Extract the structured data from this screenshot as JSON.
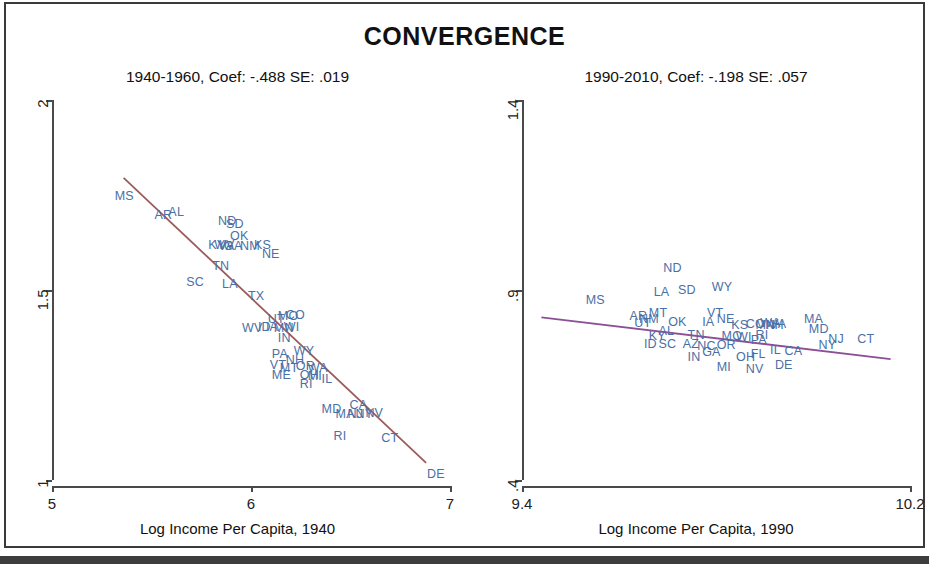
{
  "figure": {
    "title": "CONVERGENCE",
    "background": "#ffffff",
    "label_color": "#4a6fa5"
  },
  "chart_data": [
    {
      "type": "scatter",
      "panel": "left",
      "title": "1940-1960, Coef: -.488 SE: .019",
      "xlabel": "Log Income Per Capita, 1940",
      "ylabel": "",
      "xlim": [
        5,
        7
      ],
      "ylim": [
        1,
        2
      ],
      "xticks": [
        "5",
        "6",
        "7"
      ],
      "xtickvals": [
        5,
        6,
        7
      ],
      "yticks": [
        "1",
        "1.5",
        "2"
      ],
      "ytickvals": [
        1,
        1.5,
        2
      ],
      "grid": false,
      "legend": "none",
      "coefficient": -0.488,
      "standard_error": 0.019,
      "fit_line": {
        "color": "#9c5b5b",
        "x0": 5.36,
        "y0": 1.795,
        "x1": 6.88,
        "y1": 1.045
      },
      "point_label_type": "state-abbreviation",
      "points": [
        {
          "label": "MS",
          "x": 5.36,
          "y": 1.745
        },
        {
          "label": "AR",
          "x": 5.56,
          "y": 1.695
        },
        {
          "label": "AL",
          "x": 5.63,
          "y": 1.702
        },
        {
          "label": "ND",
          "x": 5.88,
          "y": 1.678
        },
        {
          "label": "SD",
          "x": 5.92,
          "y": 1.672
        },
        {
          "label": "OK",
          "x": 5.94,
          "y": 1.639
        },
        {
          "label": "KY",
          "x": 5.83,
          "y": 1.617
        },
        {
          "label": "WV",
          "x": 5.86,
          "y": 1.615
        },
        {
          "label": "VA",
          "x": 5.88,
          "y": 1.613
        },
        {
          "label": "GA",
          "x": 5.91,
          "y": 1.612
        },
        {
          "label": "NM",
          "x": 5.99,
          "y": 1.614
        },
        {
          "label": "KS",
          "x": 6.06,
          "y": 1.616
        },
        {
          "label": "NE",
          "x": 6.1,
          "y": 1.592
        },
        {
          "label": "TN",
          "x": 5.85,
          "y": 1.56
        },
        {
          "label": "SC",
          "x": 5.72,
          "y": 1.518
        },
        {
          "label": "LA",
          "x": 5.9,
          "y": 1.513
        },
        {
          "label": "TX",
          "x": 6.03,
          "y": 1.482
        },
        {
          "label": "UT",
          "x": 6.13,
          "y": 1.42
        },
        {
          "label": "MO",
          "x": 6.18,
          "y": 1.428
        },
        {
          "label": "CO",
          "x": 6.22,
          "y": 1.432
        },
        {
          "label": "WV2",
          "x": 6.0,
          "y": 1.398
        },
        {
          "label": "ID",
          "x": 6.08,
          "y": 1.4
        },
        {
          "label": "IA",
          "x": 6.12,
          "y": 1.399
        },
        {
          "label": "MN",
          "x": 6.16,
          "y": 1.398
        },
        {
          "label": "WI",
          "x": 6.21,
          "y": 1.399
        },
        {
          "label": "IN",
          "x": 6.18,
          "y": 1.371
        },
        {
          "label": "PA",
          "x": 6.15,
          "y": 1.33
        },
        {
          "label": "WY",
          "x": 6.26,
          "y": 1.337
        },
        {
          "label": "NH",
          "x": 6.22,
          "y": 1.312
        },
        {
          "label": "VT",
          "x": 6.14,
          "y": 1.3
        },
        {
          "label": "MT",
          "x": 6.19,
          "y": 1.292
        },
        {
          "label": "OR",
          "x": 6.27,
          "y": 1.298
        },
        {
          "label": "WA",
          "x": 6.33,
          "y": 1.291
        },
        {
          "label": "ME",
          "x": 6.15,
          "y": 1.275
        },
        {
          "label": "OH",
          "x": 6.29,
          "y": 1.274
        },
        {
          "label": "MI",
          "x": 6.33,
          "y": 1.271
        },
        {
          "label": "IL",
          "x": 6.4,
          "y": 1.264
        },
        {
          "label": "RI",
          "x": 6.29,
          "y": 1.25
        },
        {
          "label": "MD",
          "x": 6.4,
          "y": 1.185
        },
        {
          "label": "CA",
          "x": 6.54,
          "y": 1.196
        },
        {
          "label": "MA",
          "x": 6.47,
          "y": 1.17
        },
        {
          "label": "NJ",
          "x": 6.53,
          "y": 1.172
        },
        {
          "label": "NY",
          "x": 6.57,
          "y": 1.171
        },
        {
          "label": "NV",
          "x": 6.62,
          "y": 1.175
        },
        {
          "label": "RI2",
          "x": 6.46,
          "y": 1.112
        },
        {
          "label": "CT",
          "x": 6.7,
          "y": 1.108
        },
        {
          "label": "DE",
          "x": 6.93,
          "y": 1.012
        }
      ]
    },
    {
      "type": "scatter",
      "panel": "right",
      "title": "1990-2010, Coef: -.198 SE: .057",
      "xlabel": "Log Income Per Capita, 1990",
      "ylabel": "",
      "xlim": [
        9.4,
        10.2
      ],
      "ylim": [
        0.4,
        1.4
      ],
      "xticks": [
        "9.4",
        "10.2"
      ],
      "xtickvals": [
        9.4,
        10.2
      ],
      "yticks": [
        ".4",
        ".9",
        "1.4"
      ],
      "ytickvals": [
        0.4,
        0.9,
        1.4
      ],
      "grid": false,
      "legend": "none",
      "coefficient": -0.198,
      "standard_error": 0.057,
      "fit_line": {
        "color": "#8c4f96",
        "x0": 9.44,
        "y0": 0.828,
        "x1": 10.16,
        "y1": 0.718
      },
      "point_label_type": "state-abbreviation",
      "points": [
        {
          "label": "ND",
          "x": 9.71,
          "y": 0.955
        },
        {
          "label": "WY",
          "x": 9.81,
          "y": 0.905
        },
        {
          "label": "LA",
          "x": 9.69,
          "y": 0.892
        },
        {
          "label": "SD",
          "x": 9.74,
          "y": 0.898
        },
        {
          "label": "MS",
          "x": 9.55,
          "y": 0.872
        },
        {
          "label": "AR",
          "x": 9.64,
          "y": 0.83
        },
        {
          "label": "MT",
          "x": 9.68,
          "y": 0.838
        },
        {
          "label": "VT",
          "x": 9.8,
          "y": 0.838
        },
        {
          "label": "NM",
          "x": 9.66,
          "y": 0.82
        },
        {
          "label": "UT",
          "x": 9.65,
          "y": 0.811
        },
        {
          "label": "OK",
          "x": 9.72,
          "y": 0.814
        },
        {
          "label": "IA",
          "x": 9.79,
          "y": 0.812
        },
        {
          "label": "NE",
          "x": 9.82,
          "y": 0.82
        },
        {
          "label": "KS",
          "x": 9.85,
          "y": 0.806
        },
        {
          "label": "CO",
          "x": 9.88,
          "y": 0.808
        },
        {
          "label": "WA",
          "x": 9.91,
          "y": 0.81
        },
        {
          "label": "MN",
          "x": 9.9,
          "y": 0.806
        },
        {
          "label": "VA",
          "x": 9.93,
          "y": 0.808
        },
        {
          "label": "NH",
          "x": 9.92,
          "y": 0.804
        },
        {
          "label": "MA",
          "x": 10.0,
          "y": 0.82
        },
        {
          "label": "MD",
          "x": 10.01,
          "y": 0.795
        },
        {
          "label": "AL",
          "x": 9.7,
          "y": 0.79
        },
        {
          "label": "KY",
          "x": 9.68,
          "y": 0.776
        },
        {
          "label": "TN",
          "x": 9.76,
          "y": 0.778
        },
        {
          "label": "MO",
          "x": 9.83,
          "y": 0.776
        },
        {
          "label": "WI",
          "x": 9.86,
          "y": 0.774
        },
        {
          "label": "RI",
          "x": 9.9,
          "y": 0.778
        },
        {
          "label": "PA",
          "x": 9.89,
          "y": 0.766
        },
        {
          "label": "NJ",
          "x": 10.05,
          "y": 0.768
        },
        {
          "label": "CT",
          "x": 10.11,
          "y": 0.768
        },
        {
          "label": "ID",
          "x": 9.67,
          "y": 0.754
        },
        {
          "label": "SC",
          "x": 9.7,
          "y": 0.754
        },
        {
          "label": "AZ",
          "x": 9.75,
          "y": 0.754
        },
        {
          "label": "NC",
          "x": 9.78,
          "y": 0.75
        },
        {
          "label": "OR",
          "x": 9.82,
          "y": 0.752
        },
        {
          "label": "NY",
          "x": 10.03,
          "y": 0.752
        },
        {
          "label": "IL",
          "x": 9.93,
          "y": 0.74
        },
        {
          "label": "CA",
          "x": 9.96,
          "y": 0.736
        },
        {
          "label": "GA",
          "x": 9.79,
          "y": 0.733
        },
        {
          "label": "IN",
          "x": 9.76,
          "y": 0.722
        },
        {
          "label": "OH",
          "x": 9.86,
          "y": 0.722
        },
        {
          "label": "FL",
          "x": 9.89,
          "y": 0.73
        },
        {
          "label": "MI",
          "x": 9.82,
          "y": 0.694
        },
        {
          "label": "NV",
          "x": 9.88,
          "y": 0.69
        },
        {
          "label": "DE",
          "x": 9.94,
          "y": 0.7
        }
      ]
    }
  ]
}
